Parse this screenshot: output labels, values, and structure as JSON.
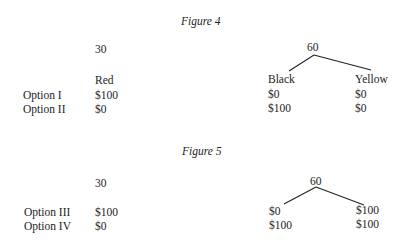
{
  "figure4": {
    "caption": "Figure 4",
    "urn_left_count": "30",
    "urn_right_count": "60",
    "headers": {
      "col1": "Red",
      "col2": "Black",
      "col3": "Yellow"
    },
    "rows": [
      {
        "label": "Option I",
        "red": "$100",
        "black": "$0",
        "yellow": "$0"
      },
      {
        "label": "Option II",
        "red": "$0",
        "black": "$100",
        "yellow": "$0"
      }
    ]
  },
  "figure5": {
    "caption": "Figure 5",
    "urn_left_count": "30",
    "urn_right_count": "60",
    "rows": [
      {
        "label": "Option III",
        "red": "$100",
        "black": "$0",
        "yellow": "$100"
      },
      {
        "label": "Option IV",
        "red": "$0",
        "black": "$100",
        "yellow": "$100"
      }
    ]
  }
}
